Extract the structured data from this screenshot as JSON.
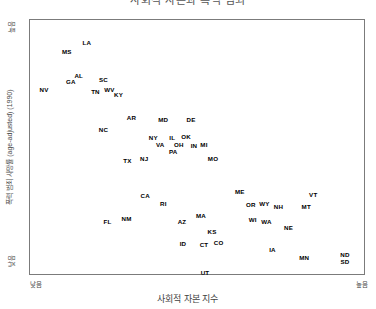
{
  "chart": {
    "title": "사회적 자본과 폭력 범죄",
    "xlabel": "사회적 자본 지수",
    "ylabel": "폭력 범죄 사망률 (age-adjusted) (1990)",
    "x_tick_low": "낮음",
    "x_tick_high": "높음",
    "y_tick_low": "낮음",
    "y_tick_high": "높음",
    "frame_color": "#7b7b7b",
    "label_color": "#000000"
  },
  "chart_data": {
    "type": "scatter",
    "title": "사회적 자본과 폭력 범죄",
    "xlabel": "사회적 자본 지수",
    "ylabel": "폭력 범죄 사망률 (age-adjusted) (1990)",
    "xlim": [
      0,
      100
    ],
    "ylim": [
      0,
      100
    ],
    "grid": false,
    "legend": null,
    "xticklabels": [
      "낮음",
      "높음"
    ],
    "yticklabels": [
      "낮음",
      "높음"
    ],
    "point_label_mode": "state-abbreviation",
    "points": [
      {
        "label": "LA",
        "x": 17.0,
        "y": 91.0
      },
      {
        "label": "MS",
        "x": 11.0,
        "y": 87.5
      },
      {
        "label": "AL",
        "x": 14.6,
        "y": 78.1
      },
      {
        "label": "GA",
        "x": 12.2,
        "y": 75.6
      },
      {
        "label": "SC",
        "x": 22.0,
        "y": 76.2
      },
      {
        "label": "NV",
        "x": 4.2,
        "y": 72.3
      },
      {
        "label": "TN",
        "x": 19.6,
        "y": 71.5
      },
      {
        "label": "WV",
        "x": 23.8,
        "y": 72.3
      },
      {
        "label": "KY",
        "x": 26.5,
        "y": 70.3
      },
      {
        "label": "AR",
        "x": 30.4,
        "y": 61.3
      },
      {
        "label": "MD",
        "x": 39.9,
        "y": 60.5
      },
      {
        "label": "DE",
        "x": 48.2,
        "y": 60.5
      },
      {
        "label": "NC",
        "x": 22.0,
        "y": 56.6
      },
      {
        "label": "NY",
        "x": 36.9,
        "y": 53.5
      },
      {
        "label": "IL",
        "x": 42.6,
        "y": 53.5
      },
      {
        "label": "OK",
        "x": 46.7,
        "y": 53.9
      },
      {
        "label": "VA",
        "x": 39.0,
        "y": 50.8
      },
      {
        "label": "OH",
        "x": 44.6,
        "y": 50.8
      },
      {
        "label": "IN",
        "x": 49.1,
        "y": 50.4
      },
      {
        "label": "MI",
        "x": 52.1,
        "y": 50.8
      },
      {
        "label": "PA",
        "x": 42.9,
        "y": 48.0
      },
      {
        "label": "TX",
        "x": 29.2,
        "y": 44.5
      },
      {
        "label": "NJ",
        "x": 34.2,
        "y": 45.3
      },
      {
        "label": "MO",
        "x": 54.8,
        "y": 45.3
      },
      {
        "label": "CA",
        "x": 34.5,
        "y": 30.9
      },
      {
        "label": "RI",
        "x": 39.9,
        "y": 27.7
      },
      {
        "label": "ME",
        "x": 62.8,
        "y": 32.4
      },
      {
        "label": "VT",
        "x": 84.8,
        "y": 31.2
      },
      {
        "label": "OR",
        "x": 66.1,
        "y": 27.3
      },
      {
        "label": "WY",
        "x": 70.2,
        "y": 27.7
      },
      {
        "label": "NH",
        "x": 74.4,
        "y": 26.2
      },
      {
        "label": "MT",
        "x": 82.7,
        "y": 26.2
      },
      {
        "label": "FL",
        "x": 23.2,
        "y": 20.3
      },
      {
        "label": "NM",
        "x": 28.9,
        "y": 21.5
      },
      {
        "label": "AZ",
        "x": 45.5,
        "y": 20.3
      },
      {
        "label": "MA",
        "x": 51.2,
        "y": 23.0
      },
      {
        "label": "WI",
        "x": 66.7,
        "y": 21.1
      },
      {
        "label": "WA",
        "x": 70.8,
        "y": 20.3
      },
      {
        "label": "NE",
        "x": 77.4,
        "y": 18.0
      },
      {
        "label": "KS",
        "x": 54.5,
        "y": 16.4
      },
      {
        "label": "ID",
        "x": 45.8,
        "y": 11.7
      },
      {
        "label": "CT",
        "x": 52.1,
        "y": 11.3
      },
      {
        "label": "CO",
        "x": 56.5,
        "y": 12.1
      },
      {
        "label": "IA",
        "x": 72.6,
        "y": 9.4
      },
      {
        "label": "MN",
        "x": 82.1,
        "y": 6.2
      },
      {
        "label": "ND",
        "x": 94.3,
        "y": 7.4
      },
      {
        "label": "SD",
        "x": 94.3,
        "y": 4.7
      },
      {
        "label": "UT",
        "x": 52.4,
        "y": 0.4
      }
    ]
  }
}
